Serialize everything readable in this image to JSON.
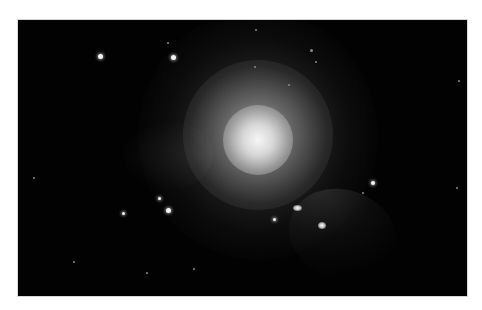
{
  "image": {
    "subject": "elliptical galaxy with surrounding stars",
    "background_color": "#ffffff",
    "frame_color": "#020202",
    "frame": {
      "left": 18,
      "top": 20,
      "width": 449,
      "height": 276
    }
  },
  "stars": [
    {
      "x": 82,
      "y": 36,
      "size": 5,
      "type": "bright"
    },
    {
      "x": 155,
      "y": 37,
      "size": 5,
      "type": "bright"
    },
    {
      "x": 150,
      "y": 190,
      "size": 5,
      "type": "bright"
    },
    {
      "x": 141,
      "y": 178,
      "size": 3,
      "type": "bright"
    },
    {
      "x": 105,
      "y": 193,
      "size": 3,
      "type": "bright"
    },
    {
      "x": 355,
      "y": 163,
      "size": 4,
      "type": "bright"
    },
    {
      "x": 345,
      "y": 173,
      "size": 2,
      "type": "faint"
    },
    {
      "x": 237,
      "y": 47,
      "size": 2,
      "type": "faint"
    },
    {
      "x": 293,
      "y": 30,
      "size": 3,
      "type": "faint"
    },
    {
      "x": 298,
      "y": 42,
      "size": 2,
      "type": "faint"
    },
    {
      "x": 150,
      "y": 23,
      "size": 2,
      "type": "faint"
    },
    {
      "x": 238,
      "y": 10,
      "size": 2,
      "type": "faint"
    },
    {
      "x": 256,
      "y": 199,
      "size": 3,
      "type": "bright"
    },
    {
      "x": 441,
      "y": 61,
      "size": 2,
      "type": "faint"
    },
    {
      "x": 439,
      "y": 168,
      "size": 2,
      "type": "faint"
    },
    {
      "x": 16,
      "y": 158,
      "size": 2,
      "type": "faint"
    },
    {
      "x": 176,
      "y": 249,
      "size": 2,
      "type": "faint"
    },
    {
      "x": 129,
      "y": 253,
      "size": 2,
      "type": "faint"
    },
    {
      "x": 56,
      "y": 242,
      "size": 2,
      "type": "faint"
    },
    {
      "x": 271,
      "y": 65,
      "size": 2,
      "type": "faint"
    }
  ],
  "small_galaxies": [
    {
      "x": 279,
      "y": 188,
      "w": 9,
      "h": 6,
      "type": "small-galaxy"
    },
    {
      "x": 304,
      "y": 205,
      "w": 8,
      "h": 7,
      "type": "small-galaxy"
    }
  ]
}
